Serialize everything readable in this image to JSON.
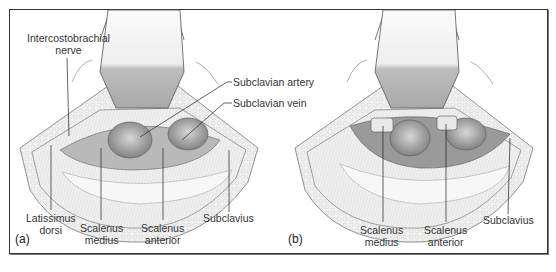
{
  "figure": {
    "panels": [
      {
        "id": "a",
        "panel_label": "(a)",
        "labels": {
          "intercostobrachial_line1": "Intercostobrachial",
          "intercostobrachial_line2": "nerve",
          "subclavian_artery": "Subclavian artery",
          "subclavian_vein": "Subclavian vein",
          "latissimus_line1": "Latissimus",
          "latissimus_line2": "dorsi",
          "scalenus_medius_line1": "Scalenus",
          "scalenus_medius_line2": "medius",
          "scalenus_anterior_line1": "Scalenus",
          "scalenus_anterior_line2": "anterior",
          "subclavius": "Subclavius"
        }
      },
      {
        "id": "b",
        "panel_label": "(b)",
        "labels": {
          "scalenus_medius_line1": "Scalenus",
          "scalenus_medius_line2": "medius",
          "scalenus_anterior_line1": "Scalenus",
          "scalenus_anterior_line2": "anterior",
          "subclavius": "Subclavius"
        }
      }
    ],
    "colors": {
      "frame": "#333333",
      "fat": "#ececec",
      "vessel": "#8e8e8e",
      "muscle": "#cfcfcf",
      "retractor": "#e6e6e6"
    }
  }
}
